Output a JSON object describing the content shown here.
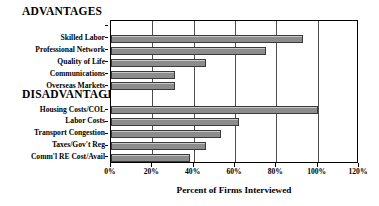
{
  "chart_data": {
    "type": "bar",
    "orientation": "horizontal",
    "title": "",
    "xlabel": "Percent of Firms Interviewed",
    "ylabel": "",
    "xlim": [
      0,
      120
    ],
    "xticks": [
      "0%",
      "20%",
      "40%",
      "60%",
      "80%",
      "100%",
      "120%"
    ],
    "xtick_values": [
      0,
      20,
      40,
      60,
      80,
      100,
      120
    ],
    "xtick_interval": 20,
    "grid": true,
    "grid_axis": "x",
    "legend": "none",
    "bar_color": "#8c8c8c",
    "bar_edge_color": "#3a3a3a",
    "groups": [
      {
        "heading": "ADVANTAGES",
        "categories": [
          "Skilled Labor",
          "Professional Network",
          "Quality of Life",
          "Communications",
          "Overseas Markets"
        ],
        "values": [
          93,
          75,
          46,
          31,
          31
        ]
      },
      {
        "heading": "DISADVANTAGES",
        "categories": [
          "Housing Costs/COL",
          "Labor Costs",
          "Transport Congestion",
          "Taxes/Gov't Reg",
          "Comm'l RE Cost/Avail"
        ],
        "values": [
          100,
          62,
          53,
          46,
          38
        ]
      }
    ],
    "rows": [
      {
        "label": "ADVANTAGES",
        "value": null,
        "is_heading": true
      },
      {
        "label": "Skilled Labor",
        "value": 93,
        "is_heading": false
      },
      {
        "label": "Professional Network",
        "value": 75,
        "is_heading": false
      },
      {
        "label": "Quality of Life",
        "value": 46,
        "is_heading": false
      },
      {
        "label": "Communications",
        "value": 31,
        "is_heading": false
      },
      {
        "label": "Overseas Markets",
        "value": 31,
        "is_heading": false
      },
      {
        "label": "DISADVANTAGES",
        "value": null,
        "is_heading": true
      },
      {
        "label": "Housing Costs/COL",
        "value": 100,
        "is_heading": false
      },
      {
        "label": "Labor Costs",
        "value": 62,
        "is_heading": false
      },
      {
        "label": "Transport Congestion",
        "value": 53,
        "is_heading": false
      },
      {
        "label": "Taxes/Gov't Reg",
        "value": 46,
        "is_heading": false
      },
      {
        "label": "Comm'l RE Cost/Avail",
        "value": 38,
        "is_heading": false
      }
    ]
  },
  "headings": {
    "advantages": "ADVANTAGES",
    "disadvantages": "DISADVANTAGES"
  }
}
